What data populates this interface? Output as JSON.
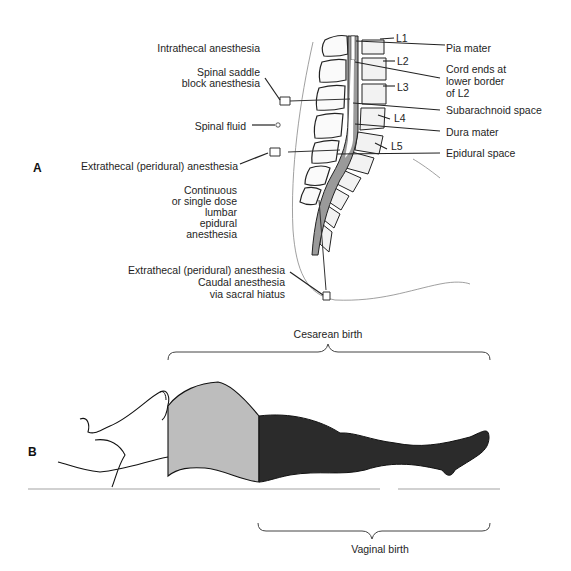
{
  "panel_a": {
    "letter": "A",
    "labels_left": {
      "intrathecal": "Intrathecal anesthesia",
      "saddle_line1": "Spinal saddle",
      "saddle_line2": "block anesthesia",
      "spinal_fluid": "Spinal fluid",
      "extrathecal": "Extrathecal (peridural) anesthesia",
      "continuous_line1": "Continuous",
      "continuous_line2": "or single dose",
      "continuous_line3": "lumbar",
      "continuous_line4": "epidural",
      "continuous_line5": "anesthesia",
      "caudal_line1": "Extrathecal (peridural) anesthesia",
      "caudal_line2": "Caudal anesthesia",
      "caudal_line3": "via sacral hiatus"
    },
    "vertebrae": [
      "L1",
      "L2",
      "L3",
      "L4",
      "L5"
    ],
    "labels_right": {
      "pia": "Pia mater",
      "cord_line1": "Cord ends at",
      "cord_line2": "lower border",
      "cord_line3": "of L2",
      "subarachnoid": "Subarachnoid space",
      "dura": "Dura mater",
      "epidural": "Epidural space"
    }
  },
  "panel_b": {
    "letter": "B",
    "cesarean": "Cesarean birth",
    "vaginal": "Vaginal birth",
    "colors": {
      "cesarean_region": "#bdbdbd",
      "vaginal_region": "#2b2b2b"
    }
  }
}
